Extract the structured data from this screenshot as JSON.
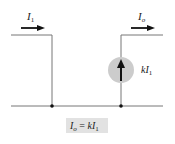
{
  "diagram": {
    "type": "current-controlled current source",
    "input_current": {
      "symbol": "I",
      "subscript": "1"
    },
    "output_current": {
      "symbol": "I",
      "subscript": "o"
    },
    "source_label": {
      "prefix": "k",
      "symbol": "I",
      "subscript": "1"
    },
    "equation": {
      "lhs": "I",
      "lhs_sub": "o",
      "eq": " = ",
      "rhs_prefix": "k",
      "rhs": "I",
      "rhs_sub": "1"
    },
    "colors": {
      "wire": "#777777",
      "arrow": "#111111",
      "source_fill": "#cccccc",
      "equation_bg": "#e2e2e2",
      "node": "#111111"
    }
  }
}
